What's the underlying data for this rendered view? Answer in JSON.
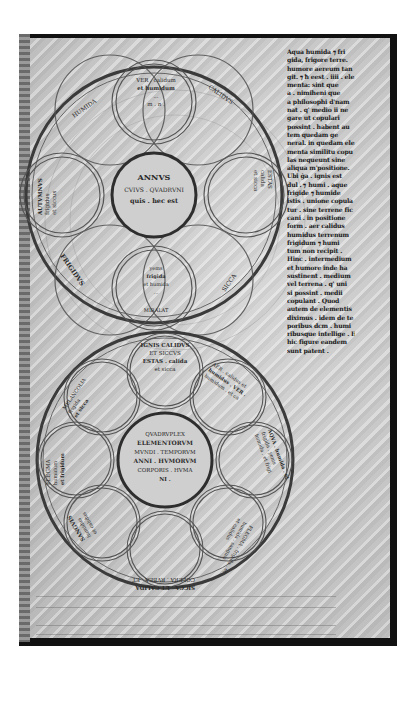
{
  "page": {
    "type": "medieval-manuscript-folio",
    "colors": {
      "parchment": "#c9c9c9",
      "ink": "#1a1a1a",
      "diagram_line": "#555555",
      "frame": "#111111"
    }
  },
  "text_column": {
    "lines": [
      "Aqua humida ⁊ fri",
      "gida, frigore terre.",
      "humore aereum tan",
      "git. ⁊ ħ eest . iiii . ele",
      "menta: sint que",
      "a . nimiheni que",
      "a philosophi d'nam",
      "nat . q' medio ii ne",
      "gare ut copulari",
      "possint . habent au",
      "tem quedam ge",
      "neral. in quedam ele",
      "menta similitu copu",
      "las nequeunt sine",
      "aliqua m'positione.",
      "Ubi ġa . ignis est",
      "dul . ⁊ humi . aque",
      "frigide ⁊ humide",
      "istis . unione copula",
      "tur . sine terrene fic",
      "cani . in positione",
      "form . aer calidus",
      "humidus terrenum",
      "frigidum ⁊ humi",
      "tum non recipit .",
      "Hinc . intermedium",
      "et humore inde ha",
      "sustinent . medium",
      "vel terrena . q' uni",
      "si possint . medii",
      "copulant . Quod",
      "autem de elementis",
      "diximus . idem de te",
      "poribus dcm . humi",
      "ribusque intellige . Hoc",
      "hic figure eandem",
      "sunt patent ."
    ]
  },
  "diagram_upper": {
    "title": "Annus (Year) rota",
    "center": [
      "ANNVS",
      "CVIVS . QVADRVNI",
      "quis . hec est",
      "."
    ],
    "petals": [
      {
        "position": "top",
        "lines": [
          "VER . calidum",
          "et humidum",
          "...",
          "m . n ."
        ]
      },
      {
        "position": "right",
        "lines": [
          "ESTAS",
          "calida",
          "et sicca",
          "iiii"
        ]
      },
      {
        "position": "bottom",
        "lines": [
          "yems",
          "frigida",
          "et humida",
          "...",
          "MIRALAT"
        ]
      },
      {
        "position": "left",
        "lines": [
          "AUTVMNVS",
          "frigidus",
          "et siccus"
        ]
      }
    ],
    "ring_labels": [
      {
        "position": "upper-left",
        "text": "HUMIDA"
      },
      {
        "position": "upper-right",
        "text": "CALIDVS"
      },
      {
        "position": "lower-right",
        "text": "SICCA"
      },
      {
        "position": "lower-left",
        "text": "FRIGIDVS"
      }
    ]
  },
  "diagram_lower": {
    "title": "Elementa / Tempora / Humores rota",
    "center": [
      "QVADRVPLEX",
      "ELEMENTORVM",
      "MVNDI . TEMPORVM",
      "ANNI . HVMORVM",
      "CORPORIS . HVMA",
      "NI ."
    ],
    "segments": [
      {
        "position": "top",
        "lines": [
          "IGNIS CALIDVS",
          "ET SICCVS",
          "ESTAS . calida",
          "et sicca"
        ]
      },
      {
        "position": "upper-right",
        "lines": [
          "AER . calidus et",
          "humidus . VER .",
          "humidum . et ca",
          "lidum"
        ]
      },
      {
        "position": "right",
        "lines": [
          "AQVA . humida . et",
          "frigida . yems",
          "humida . et frigi"
        ]
      },
      {
        "position": "lower-right",
        "lines": [
          "FLEGMA . frigida . et",
          "humida . sanguis",
          "et calidus"
        ]
      },
      {
        "position": "bottom",
        "lines": [
          "COLERA . RVBEA . ET",
          "SICCA . ET CALIDA"
        ]
      },
      {
        "position": "lower-left",
        "lines": [
          "SANGVIS",
          "humidus",
          "et calidus"
        ]
      },
      {
        "position": "left",
        "lines": [
          "FLEGMA",
          "humidum",
          "et frigidum"
        ]
      },
      {
        "position": "upper-left",
        "lines": [
          "MELANCOLIA",
          "frigida",
          "et sicca"
        ]
      }
    ]
  }
}
